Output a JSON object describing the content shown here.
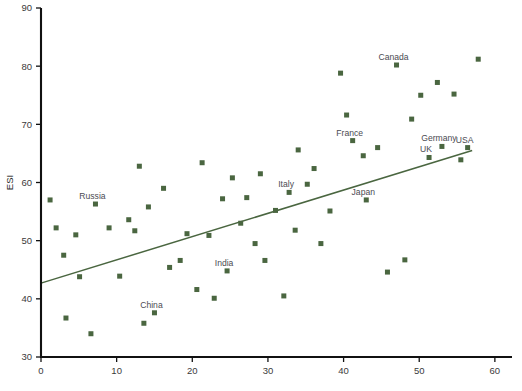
{
  "chart_data": {
    "type": "scatter",
    "title": "",
    "xlabel": "",
    "ylabel": "ESI",
    "xlim": [
      0,
      62
    ],
    "ylim": [
      30,
      90
    ],
    "xticks": [
      0,
      10,
      20,
      30,
      40,
      50,
      60
    ],
    "yticks": [
      30,
      40,
      50,
      60,
      70,
      80,
      90
    ],
    "grid": false,
    "legend": "none",
    "marker": {
      "shape": "square",
      "color": "#4a6640",
      "size": 5
    },
    "trendline": {
      "type": "linear",
      "color": "#4a6640",
      "x_start": 0.0,
      "y_start": 42.7,
      "x_end": 57.0,
      "y_end": 65.5
    },
    "points": [
      {
        "x": 1.2,
        "y": 57.0,
        "label": ""
      },
      {
        "x": 2.0,
        "y": 52.2,
        "label": ""
      },
      {
        "x": 3.0,
        "y": 47.5,
        "label": ""
      },
      {
        "x": 3.3,
        "y": 36.7,
        "label": ""
      },
      {
        "x": 4.6,
        "y": 51.0,
        "label": ""
      },
      {
        "x": 5.1,
        "y": 43.8,
        "label": ""
      },
      {
        "x": 6.6,
        "y": 34.0,
        "label": ""
      },
      {
        "x": 7.2,
        "y": 56.3,
        "label": "Russia"
      },
      {
        "x": 9.0,
        "y": 52.2,
        "label": ""
      },
      {
        "x": 10.4,
        "y": 43.9,
        "label": ""
      },
      {
        "x": 11.6,
        "y": 53.6,
        "label": ""
      },
      {
        "x": 12.4,
        "y": 51.7,
        "label": ""
      },
      {
        "x": 13.0,
        "y": 62.8,
        "label": ""
      },
      {
        "x": 13.6,
        "y": 35.8,
        "label": ""
      },
      {
        "x": 14.2,
        "y": 55.8,
        "label": ""
      },
      {
        "x": 15.0,
        "y": 37.6,
        "label": "China"
      },
      {
        "x": 16.2,
        "y": 59.0,
        "label": ""
      },
      {
        "x": 17.0,
        "y": 45.4,
        "label": ""
      },
      {
        "x": 18.4,
        "y": 46.6,
        "label": ""
      },
      {
        "x": 19.3,
        "y": 51.2,
        "label": ""
      },
      {
        "x": 20.6,
        "y": 41.6,
        "label": ""
      },
      {
        "x": 21.3,
        "y": 63.4,
        "label": ""
      },
      {
        "x": 22.2,
        "y": 50.9,
        "label": ""
      },
      {
        "x": 22.9,
        "y": 40.1,
        "label": ""
      },
      {
        "x": 24.0,
        "y": 57.2,
        "label": ""
      },
      {
        "x": 24.6,
        "y": 44.8,
        "label": "India"
      },
      {
        "x": 25.3,
        "y": 60.8,
        "label": ""
      },
      {
        "x": 26.4,
        "y": 53.0,
        "label": ""
      },
      {
        "x": 27.2,
        "y": 57.4,
        "label": ""
      },
      {
        "x": 28.3,
        "y": 49.5,
        "label": ""
      },
      {
        "x": 29.0,
        "y": 61.5,
        "label": ""
      },
      {
        "x": 29.6,
        "y": 46.6,
        "label": ""
      },
      {
        "x": 31.0,
        "y": 55.2,
        "label": ""
      },
      {
        "x": 32.1,
        "y": 40.5,
        "label": ""
      },
      {
        "x": 32.8,
        "y": 58.3,
        "label": "Italy"
      },
      {
        "x": 33.6,
        "y": 51.8,
        "label": ""
      },
      {
        "x": 34.0,
        "y": 65.6,
        "label": ""
      },
      {
        "x": 35.2,
        "y": 59.7,
        "label": ""
      },
      {
        "x": 36.1,
        "y": 62.4,
        "label": ""
      },
      {
        "x": 37.0,
        "y": 49.5,
        "label": ""
      },
      {
        "x": 38.2,
        "y": 55.1,
        "label": ""
      },
      {
        "x": 39.6,
        "y": 78.8,
        "label": ""
      },
      {
        "x": 40.4,
        "y": 71.6,
        "label": ""
      },
      {
        "x": 41.2,
        "y": 67.2,
        "label": "France"
      },
      {
        "x": 42.6,
        "y": 64.6,
        "label": ""
      },
      {
        "x": 43.0,
        "y": 57.0,
        "label": "Japan"
      },
      {
        "x": 44.5,
        "y": 66.0,
        "label": ""
      },
      {
        "x": 45.8,
        "y": 44.6,
        "label": ""
      },
      {
        "x": 47.0,
        "y": 80.2,
        "label": "Canada"
      },
      {
        "x": 48.1,
        "y": 46.7,
        "label": ""
      },
      {
        "x": 49.0,
        "y": 70.9,
        "label": ""
      },
      {
        "x": 50.2,
        "y": 75.0,
        "label": ""
      },
      {
        "x": 51.3,
        "y": 64.3,
        "label": "UK"
      },
      {
        "x": 52.4,
        "y": 77.2,
        "label": ""
      },
      {
        "x": 53.0,
        "y": 66.2,
        "label": "Germany"
      },
      {
        "x": 54.6,
        "y": 75.2,
        "label": ""
      },
      {
        "x": 55.5,
        "y": 63.9,
        "label": ""
      },
      {
        "x": 56.4,
        "y": 66.0,
        "label": "USA"
      },
      {
        "x": 57.8,
        "y": 81.2,
        "label": ""
      }
    ]
  },
  "axis": {
    "y_title": "ESI",
    "x_tick_labels": [
      "0",
      "10",
      "20",
      "30",
      "40",
      "50",
      "60"
    ],
    "y_tick_labels": [
      "30",
      "40",
      "50",
      "60",
      "70",
      "80",
      "90"
    ]
  },
  "annotations": {
    "russia": "Russia",
    "china": "China",
    "india": "India",
    "italy": "Italy",
    "japan": "Japan",
    "france": "France",
    "canada": "Canada",
    "germany": "Germany",
    "uk": "UK",
    "usa": "USA"
  }
}
